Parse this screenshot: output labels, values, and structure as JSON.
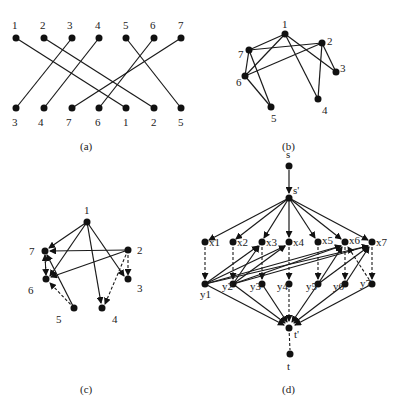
{
  "panels": {
    "a": {
      "caption": "(a)",
      "top_labels": [
        "1",
        "2",
        "3",
        "4",
        "5",
        "6",
        "7"
      ],
      "bottom_labels": [
        "3",
        "4",
        "7",
        "6",
        "1",
        "2",
        "5"
      ]
    },
    "b": {
      "caption": "(b)",
      "node_labels": {
        "n1": "1",
        "n2": "2",
        "n3": "3",
        "n4": "4",
        "n5": "5",
        "n6": "6",
        "n7": "7"
      }
    },
    "c": {
      "caption": "(c)",
      "node_labels": {
        "n1": "1",
        "n2": "2",
        "n3": "3",
        "n4": "4",
        "n5": "5",
        "n6": "6",
        "n7": "7"
      }
    },
    "d": {
      "caption": "(d)",
      "source": "s",
      "source_prime": "s'",
      "sink_prime": "t'",
      "sink": "t",
      "x_labels": [
        "x1",
        "x2",
        "x3",
        "x4",
        "x5",
        "x6",
        "x7"
      ],
      "y_labels": [
        "y1",
        "y2",
        "y3",
        "y4",
        "y5",
        "y6",
        "y7"
      ]
    }
  }
}
